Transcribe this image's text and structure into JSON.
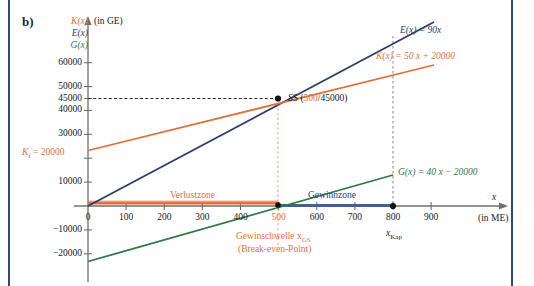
{
  "panel": {
    "label": "b)"
  },
  "chart_data": {
    "type": "line",
    "title": "",
    "xlabel": "x",
    "xunit": "(in ME)",
    "yunit": "(in GE)",
    "axis_names": [
      "K(x)",
      "E(x)",
      "G(x)"
    ],
    "xlim": [
      -40,
      960
    ],
    "ylim": [
      -24000,
      66000
    ],
    "xticks": [
      0,
      100,
      200,
      300,
      400,
      500,
      600,
      700,
      800,
      900
    ],
    "xticklabels": [
      "0",
      "100",
      "200",
      "300",
      "400",
      "500",
      "600",
      "700",
      "800",
      "900"
    ],
    "yticks": [
      -20000,
      -10000,
      10000,
      20000,
      30000,
      40000,
      45000,
      50000,
      60000
    ],
    "yticklabels": [
      "−20000",
      "−10000",
      "10000",
      "20000",
      "30000",
      "40000",
      "45000",
      "50000",
      "60000"
    ],
    "grid": false,
    "legend": "inline-annotations",
    "series": [
      {
        "name": "E(x)",
        "label": "E(x) = 90x",
        "color": "#2b3f6b",
        "formula_slope": 90,
        "formula_intercept": 0,
        "x": [
          0,
          800
        ],
        "y": [
          0,
          72000
        ]
      },
      {
        "name": "K(x)",
        "label": "K(x) = 50 x + 20000",
        "color": "#E2703A",
        "formula_slope": 50,
        "formula_intercept": 20000,
        "x": [
          0,
          800
        ],
        "y": [
          20000,
          60000
        ]
      },
      {
        "name": "G(x)",
        "label": "G(x) = 40 x − 20000",
        "color": "#2f7a44",
        "formula_slope": 40,
        "formula_intercept": -20000,
        "x": [
          0,
          800
        ],
        "y": [
          -20000,
          12000
        ]
      }
    ],
    "annotations": {
      "fixed_cost": "Kᵢ = 20000",
      "fixed_cost_value": 20000,
      "intersection_label_prefix": "S (",
      "intersection_x": "500",
      "intersection_sep": "/",
      "intersection_y": "45000",
      "intersection_label_suffix": ")",
      "loss_zone": "Verlustzone",
      "profit_zone": "Gewinnzone",
      "breakeven_line1": "Gewinschwelle x",
      "breakeven_line1_sub": "GS",
      "breakeven_line2": "(Break-even-Point)",
      "capacity_label": "x",
      "capacity_sub": "Kap",
      "capacity_value": 800,
      "loss_zone_range": [
        0,
        500
      ],
      "profit_zone_range": [
        500,
        800
      ],
      "guide_y": 45000,
      "guide_x_breakeven": 500,
      "guide_x_capacity": 800
    },
    "colors": {
      "cost": "#E2703A",
      "revenue": "#2b3f6b",
      "profit": "#2f7a44",
      "axis": "#6e6e6e",
      "rule": "#2b4a78",
      "text": "#1a1a1a"
    }
  }
}
